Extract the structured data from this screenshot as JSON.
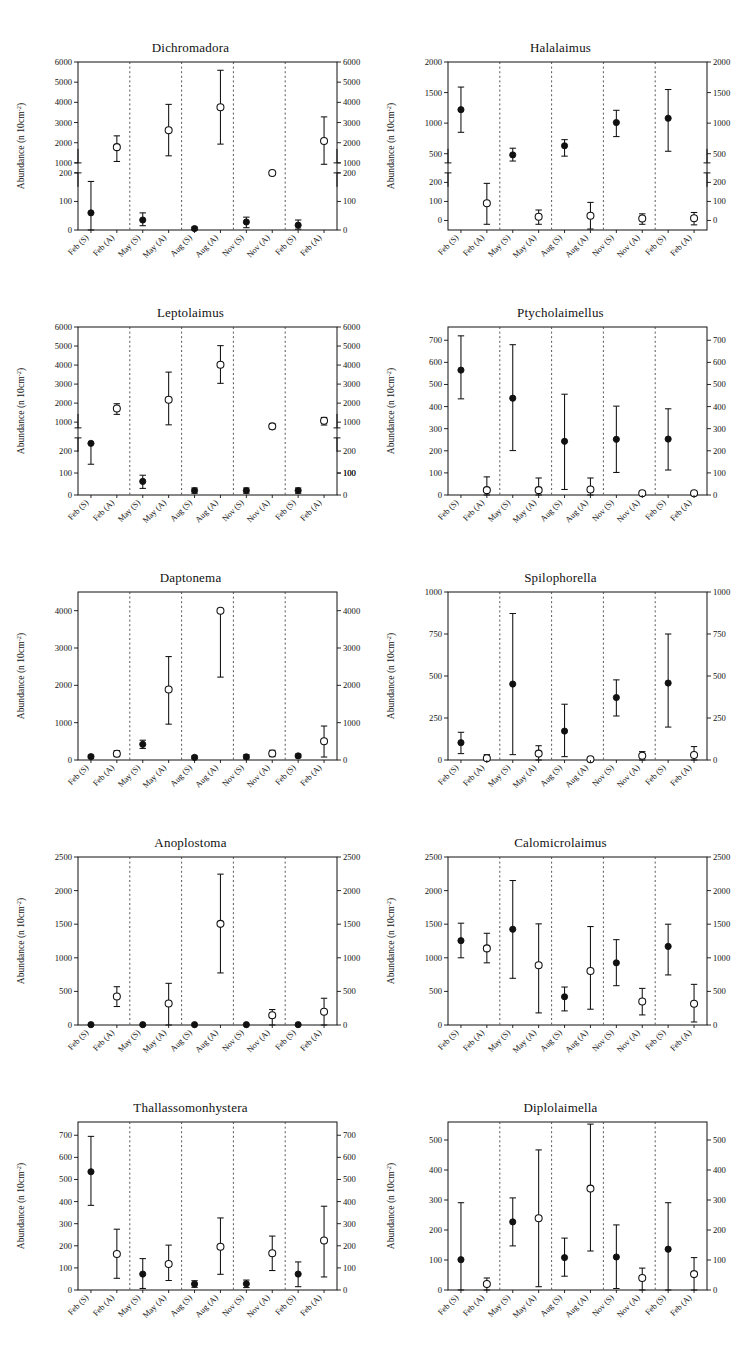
{
  "figure": {
    "axis_title": "Abundance (n 10cm",
    "axis_title_sup": "-2",
    "axis_title_tail": ")",
    "categories": [
      "Feb (S)",
      "Feb (A)",
      "May (S)",
      "May (A)",
      "Aug (S)",
      "Aug (A)",
      "Nov (S)",
      "Nov (A)",
      "Feb (S)",
      "Feb (A)"
    ],
    "marker_legend": {
      "filled": "S (filled circle)",
      "open": "A (open circle)"
    },
    "colors": {
      "ink": "#111111",
      "paper": "#ffffff",
      "separator": "#444444"
    }
  },
  "chart_data": [
    {
      "type": "scatter",
      "title": "Dichromadora",
      "xlabel": "",
      "ylabel": "Abundance (n 10cm-2)",
      "grid": false,
      "legend": "none",
      "broken_axis": true,
      "ylim_lower": [
        0,
        200
      ],
      "ylim_upper": [
        1000,
        6000
      ],
      "yticks_lower": [
        0,
        100,
        200
      ],
      "yticks_upper": [
        1000,
        2000,
        3000,
        4000,
        5000,
        6000
      ],
      "categories": [
        "Feb (S)",
        "Feb (A)",
        "May (S)",
        "May (A)",
        "Aug (S)",
        "Aug (A)",
        "Nov (S)",
        "Nov (A)",
        "Feb (S)",
        "Feb (A)"
      ],
      "marker": [
        "filled",
        "open",
        "filled",
        "open",
        "filled",
        "open",
        "filled",
        "open",
        "filled",
        "open"
      ],
      "values": [
        60,
        1780,
        35,
        2620,
        5,
        3760,
        28,
        500,
        17,
        2080
      ],
      "err_low": [
        60,
        710,
        20,
        1270,
        5,
        1830,
        20,
        null,
        14,
        1150
      ],
      "err_high": [
        110,
        560,
        25,
        1280,
        5,
        1830,
        17,
        null,
        18,
        1200
      ]
    },
    {
      "type": "scatter",
      "title": "Halalaimus",
      "xlabel": "",
      "ylabel": "Abundance (n 10cm-2)",
      "grid": false,
      "legend": "none",
      "broken_axis": true,
      "ylim_lower": [
        -50,
        250
      ],
      "ylim_upper": [
        350,
        2000
      ],
      "yticks_lower": [
        0,
        100,
        200
      ],
      "yticks_upper": [
        500,
        1000,
        1500,
        2000
      ],
      "categories": [
        "Feb (S)",
        "Feb (A)",
        "May (S)",
        "May (A)",
        "Aug (S)",
        "Aug (A)",
        "Nov (S)",
        "Nov (A)",
        "Feb (S)",
        "Feb (A)"
      ],
      "marker": [
        "filled",
        "open",
        "filled",
        "open",
        "filled",
        "open",
        "filled",
        "open",
        "filled",
        "open"
      ],
      "values": [
        1220,
        90,
        480,
        20,
        630,
        25,
        1010,
        10,
        1080,
        12
      ],
      "err_low": [
        370,
        110,
        100,
        40,
        170,
        70,
        230,
        30,
        540,
        35
      ],
      "err_high": [
        370,
        105,
        110,
        35,
        100,
        70,
        200,
        25,
        470,
        30
      ]
    },
    {
      "type": "scatter",
      "title": "Leptolaimus",
      "xlabel": "",
      "ylabel": "Abundance (n 10cm-2)",
      "grid": false,
      "legend": "none",
      "broken_axis": true,
      "ylim_lower": [
        0,
        260
      ],
      "ylim_upper": [
        700,
        6000
      ],
      "yticks_lower": [
        0,
        100,
        200
      ],
      "yticks_upper": [
        1000,
        2000,
        3000,
        4000,
        5000,
        6000
      ],
      "yticks_upper_right": [
        100,
        1000,
        2000,
        3000,
        4000,
        5000,
        6000
      ],
      "categories": [
        "Feb (S)",
        "Feb (A)",
        "May (S)",
        "May (A)",
        "Aug (S)",
        "Aug (A)",
        "Nov (S)",
        "Nov (A)",
        "Feb (S)",
        "Feb (A)"
      ],
      "marker": [
        "filled",
        "open",
        "filled",
        "open",
        "filled",
        "open",
        "filled",
        "open",
        "filled",
        "open"
      ],
      "values": [
        235,
        1720,
        62,
        2180,
        20,
        4020,
        20,
        780,
        20,
        1070
      ],
      "err_low": [
        95,
        310,
        32,
        1320,
        12,
        980,
        12,
        130,
        12,
        220
      ],
      "err_high": [
        0,
        250,
        28,
        1450,
        12,
        1000,
        12,
        130,
        12,
        180
      ]
    },
    {
      "type": "scatter",
      "title": "Ptycholaimellus",
      "xlabel": "",
      "ylabel": "Abundance (n 10cm-2)",
      "grid": false,
      "legend": "none",
      "broken_axis": false,
      "ylim": [
        0,
        760
      ],
      "yticks": [
        0,
        100,
        200,
        300,
        400,
        500,
        600,
        700
      ],
      "categories": [
        "Feb (S)",
        "Feb (A)",
        "May (S)",
        "May (A)",
        "Aug (S)",
        "Aug (A)",
        "Nov (S)",
        "Nov (A)",
        "Feb (S)",
        "Feb (A)"
      ],
      "marker": [
        "filled",
        "open",
        "filled",
        "open",
        "filled",
        "open",
        "filled",
        "open",
        "filled",
        "open"
      ],
      "values": [
        565,
        22,
        438,
        22,
        243,
        25,
        252,
        8,
        253,
        8
      ],
      "err_low": [
        130,
        22,
        237,
        22,
        218,
        25,
        150,
        8,
        140,
        8
      ],
      "err_high": [
        155,
        60,
        242,
        55,
        213,
        52,
        150,
        5,
        137,
        5
      ]
    },
    {
      "type": "scatter",
      "title": "Daptonema",
      "xlabel": "",
      "ylabel": "Abundance (n 10cm-2)",
      "grid": false,
      "legend": "none",
      "broken_axis": false,
      "ylim": [
        0,
        4500
      ],
      "yticks": [
        0,
        1000,
        2000,
        3000,
        4000
      ],
      "categories": [
        "Feb (S)",
        "Feb (A)",
        "May (S)",
        "May (A)",
        "Aug (S)",
        "Aug (A)",
        "Nov (S)",
        "Nov (A)",
        "Feb (S)",
        "Feb (A)"
      ],
      "marker": [
        "filled",
        "open",
        "filled",
        "open",
        "filled",
        "open",
        "filled",
        "open",
        "filled",
        "open"
      ],
      "values": [
        90,
        170,
        420,
        1890,
        70,
        4000,
        85,
        175,
        110,
        500
      ],
      "err_low": [
        40,
        80,
        110,
        930,
        35,
        1780,
        55,
        85,
        45,
        420
      ],
      "err_high": [
        40,
        80,
        110,
        880,
        35,
        0,
        55,
        85,
        45,
        410
      ]
    },
    {
      "type": "scatter",
      "title": "Spilophorella",
      "xlabel": "",
      "ylabel": "Abundance (n 10cm-2)",
      "grid": false,
      "legend": "none",
      "broken_axis": false,
      "ylim": [
        0,
        1000
      ],
      "yticks": [
        0,
        250,
        500,
        750,
        1000
      ],
      "categories": [
        "Feb (S)",
        "Feb (A)",
        "May (S)",
        "May (A)",
        "Aug (S)",
        "Aug (A)",
        "Nov (S)",
        "Nov (A)",
        "Feb (S)",
        "Feb (A)"
      ],
      "marker": [
        "filled",
        "open",
        "filled",
        "open",
        "filled",
        "open",
        "filled",
        "open",
        "filled",
        "open"
      ],
      "values": [
        103,
        10,
        452,
        38,
        172,
        5,
        372,
        25,
        458,
        30
      ],
      "err_low": [
        65,
        10,
        420,
        38,
        152,
        5,
        110,
        25,
        262,
        30
      ],
      "err_high": [
        62,
        22,
        420,
        47,
        160,
        5,
        105,
        25,
        292,
        50
      ]
    },
    {
      "type": "scatter",
      "title": "Anoplostoma",
      "xlabel": "",
      "ylabel": "Abundance (n 10cm-2)",
      "grid": false,
      "legend": "none",
      "broken_axis": false,
      "ylim": [
        0,
        2500
      ],
      "yticks": [
        0,
        500,
        1000,
        1500,
        2000,
        2500
      ],
      "categories": [
        "Feb (S)",
        "Feb (A)",
        "May (S)",
        "May (A)",
        "Aug (S)",
        "Aug (A)",
        "Nov (S)",
        "Nov (A)",
        "Feb (S)",
        "Feb (A)"
      ],
      "marker": [
        "filled",
        "open",
        "filled",
        "open",
        "filled",
        "open",
        "filled",
        "open",
        "filled",
        "open"
      ],
      "values": [
        5,
        425,
        5,
        320,
        5,
        1505,
        5,
        145,
        5,
        198,
        0
      ],
      "err_low": [
        0,
        150,
        0,
        320,
        0,
        730,
        0,
        145,
        0,
        198
      ],
      "err_high": [
        0,
        145,
        0,
        300,
        0,
        740,
        0,
        85,
        0,
        200
      ]
    },
    {
      "type": "scatter",
      "title": "Calomicrolaimus",
      "xlabel": "",
      "ylabel": "Abundance (n 10cm-2)",
      "grid": false,
      "legend": "none",
      "broken_axis": false,
      "ylim": [
        0,
        2500
      ],
      "yticks": [
        0,
        500,
        1000,
        1500,
        2000,
        2500
      ],
      "categories": [
        "Feb (S)",
        "Feb (A)",
        "May (S)",
        "May (A)",
        "Aug (S)",
        "Aug (A)",
        "Nov (S)",
        "Nov (A)",
        "Feb (S)",
        "Feb (A)"
      ],
      "marker": [
        "filled",
        "open",
        "filled",
        "open",
        "filled",
        "open",
        "filled",
        "open",
        "filled",
        "open"
      ],
      "values": [
        1255,
        1140,
        1425,
        890,
        420,
        805,
        925,
        350,
        1170,
        315
      ],
      "err_low": [
        255,
        215,
        730,
        710,
        210,
        570,
        340,
        200,
        425,
        270
      ],
      "err_high": [
        260,
        225,
        725,
        615,
        145,
        660,
        345,
        195,
        330,
        290
      ]
    },
    {
      "type": "scatter",
      "title": "Thallassomonhystera",
      "xlabel": "",
      "ylabel": "Abundance (n 10cm-2)",
      "grid": false,
      "legend": "none",
      "broken_axis": false,
      "ylim": [
        0,
        760
      ],
      "yticks": [
        0,
        100,
        200,
        300,
        400,
        500,
        600,
        700
      ],
      "categories": [
        "Feb (S)",
        "Feb (A)",
        "May (S)",
        "May (A)",
        "Aug (S)",
        "Aug (A)",
        "Nov (S)",
        "Nov (A)",
        "Feb (S)",
        "Feb (A)"
      ],
      "marker": [
        "filled",
        "open",
        "filled",
        "open",
        "filled",
        "open",
        "filled",
        "open",
        "filled",
        "open"
      ],
      "values": [
        535,
        163,
        72,
        118,
        27,
        196,
        28,
        166,
        72,
        224
      ],
      "err_low": [
        152,
        110,
        65,
        75,
        15,
        125,
        17,
        78,
        57,
        165
      ],
      "err_high": [
        160,
        112,
        70,
        85,
        15,
        130,
        17,
        78,
        55,
        155
      ]
    },
    {
      "type": "scatter",
      "title": "Diplolaimella",
      "xlabel": "",
      "ylabel": "Abundance (n 10cm-2)",
      "grid": false,
      "legend": "none",
      "broken_axis": false,
      "ylim": [
        0,
        560
      ],
      "yticks": [
        0,
        100,
        200,
        300,
        400,
        500
      ],
      "categories": [
        "Feb (S)",
        "Feb (A)",
        "May (S)",
        "May (A)",
        "Aug (S)",
        "Aug (A)",
        "Nov (S)",
        "Nov (A)",
        "Feb (S)",
        "Feb (A)"
      ],
      "marker": [
        "filled",
        "open",
        "filled",
        "open",
        "filled",
        "open",
        "filled",
        "open",
        "filled",
        "open"
      ],
      "values": [
        101,
        20,
        227,
        239,
        108,
        338,
        110,
        40,
        136,
        53
      ],
      "err_low": [
        101,
        20,
        80,
        228,
        62,
        208,
        105,
        40,
        136,
        53
      ],
      "err_high": [
        190,
        20,
        80,
        228,
        65,
        215,
        107,
        33,
        155,
        55
      ]
    }
  ]
}
